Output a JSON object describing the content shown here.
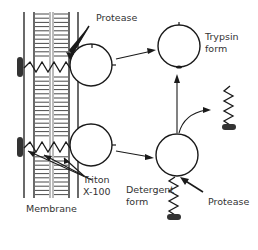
{
  "diagram": {
    "labels": {
      "protease_top": "Protease",
      "trypsin_form_line1": "Trypsin",
      "trypsin_form_line2": "form",
      "triton_line1": "Triton",
      "triton_line2": "X-100",
      "membrane": "Membrane",
      "detergent_form_line1": "Detergent",
      "detergent_form_line2": "form",
      "protease_bottom": "Protease"
    },
    "caption": "",
    "colors": {
      "ink": "#1a1a1a",
      "background": "#ffffff"
    },
    "nodes": [
      {
        "id": "membrane",
        "label": "Membrane"
      },
      {
        "id": "bound_enzyme_top",
        "label": ""
      },
      {
        "id": "bound_enzyme_bottom",
        "label": ""
      },
      {
        "id": "trypsin_form",
        "label": "Trypsin form"
      },
      {
        "id": "detergent_form",
        "label": "Detergent form"
      },
      {
        "id": "released_anchor",
        "label": ""
      }
    ],
    "edges": [
      {
        "from": "bound_enzyme_top",
        "to": "trypsin_form",
        "via": "Protease"
      },
      {
        "from": "bound_enzyme_bottom",
        "to": "detergent_form",
        "via": "Triton X-100"
      },
      {
        "from": "detergent_form",
        "to": "trypsin_form",
        "via": "Protease"
      },
      {
        "from": "detergent_form",
        "to": "released_anchor",
        "via": "Protease"
      }
    ]
  }
}
